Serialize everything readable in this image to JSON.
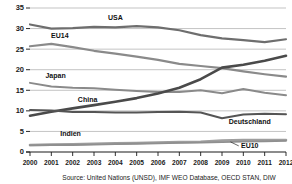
{
  "chart_data": {
    "type": "line",
    "title": "",
    "subtitle": "",
    "xlabel": "",
    "ylabel": "",
    "x": [
      2000,
      2001,
      2002,
      2003,
      2004,
      2005,
      2006,
      2007,
      2008,
      2009,
      2010,
      2011,
      2012
    ],
    "xtick_labels": [
      "2000",
      "2001",
      "2002",
      "2003",
      "2004",
      "2005",
      "2006",
      "2007",
      "2008",
      "2009",
      "2010",
      "2011",
      "2012"
    ],
    "ytick_labels": [
      "0",
      "5",
      "10",
      "15",
      "20",
      "25",
      "30",
      "35"
    ],
    "ytick_values": [
      0,
      5,
      10,
      15,
      20,
      25,
      30,
      35
    ],
    "xlim": [
      2000,
      2012
    ],
    "ylim": [
      0,
      35
    ],
    "grid": true,
    "grid_axis": "y",
    "legend_position": "inline-labels",
    "series": [
      {
        "name": "USA",
        "label": "USA",
        "color": "#6e6e6e",
        "width": 2.2,
        "label_x": 2004.0,
        "label_y": 32.2,
        "values": [
          31.0,
          30.0,
          30.1,
          30.4,
          30.3,
          30.6,
          30.3,
          29.6,
          28.4,
          27.6,
          27.2,
          26.7,
          27.4
        ]
      },
      {
        "name": "EU14",
        "label": "EU14",
        "color": "#8a8a8a",
        "width": 2.2,
        "label_x": 2001.4,
        "label_y": 27.6,
        "values": [
          25.7,
          26.3,
          25.5,
          24.6,
          23.9,
          23.2,
          22.4,
          21.4,
          20.9,
          20.4,
          19.6,
          18.9,
          18.3
        ]
      },
      {
        "name": "Japan",
        "label": "Japan",
        "color": "#8a8a8a",
        "width": 2.0,
        "label_x": 2001.2,
        "label_y": 18.0,
        "values": [
          16.8,
          15.9,
          15.6,
          15.5,
          15.1,
          14.8,
          14.6,
          14.6,
          15.0,
          14.3,
          15.3,
          14.4,
          13.8
        ]
      },
      {
        "name": "China",
        "label": "China",
        "color": "#4a4a4a",
        "width": 2.6,
        "label_x": 2002.7,
        "label_y": 12.2,
        "values": [
          8.8,
          9.8,
          10.6,
          11.4,
          12.2,
          13.1,
          14.2,
          15.6,
          17.7,
          20.5,
          21.2,
          22.2,
          23.4
        ]
      },
      {
        "name": "Deutschland",
        "label": "Deutschland",
        "color": "#555555",
        "width": 2.0,
        "label_x": 2010.3,
        "label_y": 6.9,
        "values": [
          10.2,
          10.1,
          9.7,
          9.7,
          9.6,
          9.6,
          9.7,
          9.8,
          9.6,
          8.2,
          9.1,
          9.3,
          9.2
        ]
      },
      {
        "name": "Indien",
        "label": "Indien",
        "color": "#9e9e9e",
        "width": 2.6,
        "label_x": 2001.9,
        "label_y": 4.0,
        "values": [
          1.7,
          1.8,
          1.9,
          2.0,
          2.1,
          2.2,
          2.3,
          2.4,
          2.5,
          2.8,
          2.9,
          2.9,
          2.9
        ]
      },
      {
        "name": "EU10",
        "label": "EU10",
        "color": "#8f8f8f",
        "width": 1.8,
        "label_x": 2010.3,
        "label_y": 1.0,
        "values": [
          1.6,
          1.7,
          1.7,
          1.8,
          1.9,
          2.0,
          2.1,
          2.2,
          2.3,
          2.4,
          2.5,
          2.6,
          2.7
        ]
      }
    ]
  },
  "footer": {
    "source": "Source: United Nations (UNSD), IMF WEO Database, OECD STAN, DIW"
  },
  "colors": {
    "gridline": "#9a9a9a",
    "axis": "#1a1a1a",
    "text": "#1a1a1a",
    "background": "#ffffff"
  }
}
